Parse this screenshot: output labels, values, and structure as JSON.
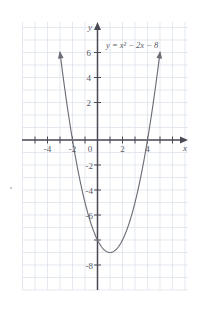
{
  "figure": {
    "equation_label": "y = x² − 2x − 8",
    "x_axis_label": "x",
    "y_axis_label": "y",
    "curve_color": "#6e6e78",
    "grid_color": "#d7dde6",
    "axis_color": "#4a4a55",
    "label_color": "#5a5a66",
    "background": "#ffffff"
  },
  "chart_data": {
    "type": "line",
    "title": "",
    "subtitle": "",
    "xlabel": "x",
    "ylabel": "y",
    "annotations": [
      "y = x² − 2x − 8"
    ],
    "legend": [],
    "legend_position": "none",
    "grid": true,
    "xlim": [
      -6,
      7
    ],
    "ylim": [
      -10,
      7
    ],
    "xticks": [
      -4,
      -2,
      0,
      2,
      4
    ],
    "xtick_labels": [
      "-4",
      "-2",
      "0",
      "2",
      "4"
    ],
    "yticks": [
      -8,
      -6,
      -4,
      -2,
      0,
      2,
      4,
      6
    ],
    "ytick_labels": [
      "-8",
      "-6",
      "-4",
      "-2",
      "0",
      "2",
      "4",
      "6"
    ],
    "grid_step": 1,
    "series": [
      {
        "name": "y = x² − 2x − 8",
        "equation": "y = x^2 - 2x - 8",
        "roots": [
          -2,
          4
        ],
        "vertex": [
          1,
          -9
        ],
        "y_intercept": -8,
        "x": [
          -3.0,
          -2.75,
          -2.5,
          -2.25,
          -2.0,
          -1.75,
          -1.5,
          -1.25,
          -1.0,
          -0.75,
          -0.5,
          -0.25,
          0.0,
          0.25,
          0.5,
          0.75,
          1.0,
          1.25,
          1.5,
          1.75,
          2.0,
          2.25,
          2.5,
          2.75,
          3.0,
          3.25,
          3.5,
          3.75,
          4.0,
          4.25,
          4.5,
          4.75,
          5.0
        ],
        "y": [
          7.0,
          5.0625,
          3.25,
          1.5625,
          0.0,
          -1.4375,
          -2.75,
          -3.9375,
          -5.0,
          -5.9375,
          -6.75,
          -7.4375,
          -8.0,
          -8.4375,
          -8.75,
          -8.9375,
          -9.0,
          -8.9375,
          -8.75,
          -8.4375,
          -8.0,
          -7.4375,
          -6.75,
          -5.9375,
          -5.0,
          -3.9375,
          -2.75,
          -1.4375,
          0.0,
          1.5625,
          3.25,
          5.0625,
          7.0
        ]
      }
    ]
  },
  "ticks": {
    "x": [
      {
        "label": "-4",
        "value": -4
      },
      {
        "label": "-2",
        "value": -2
      },
      {
        "label": "0",
        "value": 0
      },
      {
        "label": "2",
        "value": 2
      },
      {
        "label": "4",
        "value": 4
      }
    ],
    "y": [
      {
        "label": "6",
        "value": 6
      },
      {
        "label": "4",
        "value": 4
      },
      {
        "label": "2",
        "value": 2
      },
      {
        "label": "-2",
        "value": -2
      },
      {
        "label": "-4",
        "value": -4
      },
      {
        "label": "-6",
        "value": -6
      },
      {
        "label": "-8",
        "value": -8
      }
    ]
  }
}
